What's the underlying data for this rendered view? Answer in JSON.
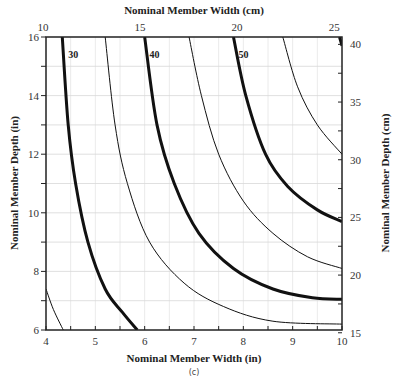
{
  "chart_data": {
    "type": "line",
    "title": "",
    "subtitle": "(c)",
    "xlabel": "Nominal Member Width (in)",
    "ylabel": "Nominal Member Depth (in)",
    "x2label": "Nominal Member Width (cm)",
    "y2label": "Nominal Member Depth (cm)",
    "xlim": [
      4,
      10
    ],
    "ylim": [
      6,
      16
    ],
    "x_ticks": [
      4,
      5,
      6,
      7,
      8,
      9,
      10
    ],
    "y_ticks": [
      6,
      8,
      10,
      12,
      14,
      16
    ],
    "x2_ticks": [
      10,
      15,
      20,
      25
    ],
    "y2_ticks": [
      15,
      20,
      25,
      30,
      35,
      40
    ],
    "grid": true,
    "legend": "none",
    "series": [
      {
        "name": "25 (thin)",
        "weight": "thin",
        "points": [
          [
            4.0,
            7.4
          ],
          [
            4.15,
            6.7
          ],
          [
            4.35,
            6.0
          ]
        ]
      },
      {
        "name": "30",
        "weight": "thick",
        "label": "30",
        "points": [
          [
            4.33,
            16
          ],
          [
            4.45,
            13
          ],
          [
            4.6,
            11
          ],
          [
            4.85,
            9
          ],
          [
            5.2,
            7.4
          ],
          [
            5.55,
            6.6
          ],
          [
            5.85,
            6.0
          ]
        ]
      },
      {
        "name": "35 (thin)",
        "weight": "thin",
        "points": [
          [
            5.2,
            16
          ],
          [
            5.4,
            13
          ],
          [
            5.65,
            11
          ],
          [
            6.1,
            9
          ],
          [
            6.8,
            7.6
          ],
          [
            7.6,
            6.8
          ],
          [
            8.6,
            6.3
          ],
          [
            10,
            6.2
          ]
        ]
      },
      {
        "name": "40",
        "weight": "thick",
        "label": "40",
        "points": [
          [
            6.0,
            16
          ],
          [
            6.25,
            13
          ],
          [
            6.6,
            11
          ],
          [
            7.1,
            9.3
          ],
          [
            7.8,
            8.1
          ],
          [
            8.6,
            7.4
          ],
          [
            9.4,
            7.1
          ],
          [
            10,
            7.05
          ]
        ]
      },
      {
        "name": "45 (thin)",
        "weight": "thin",
        "points": [
          [
            6.9,
            16
          ],
          [
            7.15,
            14
          ],
          [
            7.5,
            12
          ],
          [
            8.0,
            10.4
          ],
          [
            8.6,
            9.3
          ],
          [
            9.3,
            8.5
          ],
          [
            10,
            8.1
          ]
        ]
      },
      {
        "name": "50",
        "weight": "thick",
        "label": "50",
        "points": [
          [
            7.8,
            16
          ],
          [
            8.05,
            14
          ],
          [
            8.45,
            12
          ],
          [
            8.9,
            10.9
          ],
          [
            9.5,
            10.1
          ],
          [
            10,
            9.7
          ]
        ]
      },
      {
        "name": "55 (thin)",
        "weight": "thin",
        "points": [
          [
            8.8,
            16
          ],
          [
            9.1,
            14.3
          ],
          [
            9.5,
            13
          ],
          [
            10,
            12.0
          ]
        ]
      },
      {
        "name": "60",
        "weight": "thick",
        "points": [
          [
            9.95,
            16
          ],
          [
            10,
            15.7
          ]
        ]
      }
    ],
    "annotations": [
      {
        "text": "30",
        "x": 4.45,
        "y": 15.3
      },
      {
        "text": "40",
        "x": 6.1,
        "y": 15.3
      },
      {
        "text": "50",
        "x": 7.9,
        "y": 15.3
      }
    ]
  }
}
